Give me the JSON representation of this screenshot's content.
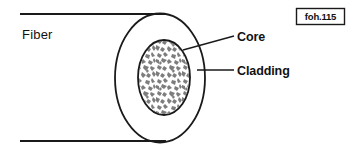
{
  "figure": {
    "plate_code": "foh.115",
    "background_color": "#ffffff",
    "stroke_color": "#1a1a1a",
    "core_fill_color": "#808080",
    "labels": {
      "fiber": "Fiber",
      "core": "Core",
      "cladding": "Cladding"
    },
    "parts": [
      {
        "name": "fiber",
        "label": "Fiber",
        "shape": "two-parallel-horizontal-lines",
        "x_start": 20,
        "x_end": 166,
        "y_top": 14,
        "y_bottom": 141
      },
      {
        "name": "cladding",
        "label": "Cladding",
        "shape": "ellipse",
        "center_x": 160,
        "center_y": 78,
        "radius_x": 45,
        "radius_y": 64.5,
        "fill": "none"
      },
      {
        "name": "core",
        "label": "Core",
        "shape": "ellipse",
        "center_x": 164,
        "center_y": 77.5,
        "radius_x": 26,
        "radius_y": 37.5,
        "fill": "speckled-gray"
      }
    ],
    "leaders": [
      {
        "name": "core-leader",
        "target": "core",
        "from_x": 183,
        "from_y": 50,
        "to_x": 234,
        "to_y": 36
      },
      {
        "name": "cladding-leader",
        "target": "cladding",
        "from_x": 197,
        "from_y": 70,
        "to_x": 234,
        "to_y": 70
      }
    ]
  }
}
